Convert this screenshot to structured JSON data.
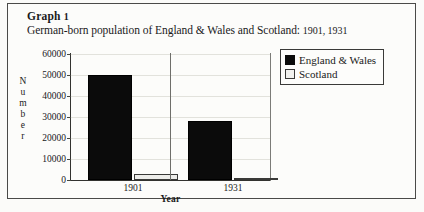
{
  "figure": {
    "label": "Graph",
    "number": "1",
    "caption_main": "German-born population of England & Wales and Scotland:",
    "caption_years": "1901, 1931"
  },
  "legend": {
    "position": "top-right",
    "entries": [
      {
        "label": "England & Wales",
        "color": "#0b0b0b",
        "icon": "legend-swatch-filled"
      },
      {
        "label": "Scotland",
        "color": "#ededea",
        "icon": "legend-swatch-open"
      }
    ]
  },
  "axes": {
    "ylabel_letters": [
      "N",
      "u",
      "m",
      "b",
      "e",
      "r"
    ],
    "ylabel": "Number",
    "xlabel": "Year",
    "yticks": [
      "0",
      "10000",
      "20000",
      "30000",
      "40000",
      "50000",
      "60000"
    ]
  },
  "chart_data": {
    "type": "bar",
    "title": "German-born population of England & Wales and Scotland: 1901, 1931",
    "categories": [
      "1901",
      "1931"
    ],
    "series": [
      {
        "name": "England & Wales",
        "color": "#0b0b0b",
        "values": [
          50000,
          28000
        ]
      },
      {
        "name": "Scotland",
        "color": "#ededea",
        "values": [
          2800,
          1000
        ]
      }
    ],
    "xlabel": "Year",
    "ylabel": "Number",
    "ylim": [
      0,
      60000
    ],
    "ytick_step": 10000,
    "grid": true,
    "legend_position": "top-right"
  }
}
